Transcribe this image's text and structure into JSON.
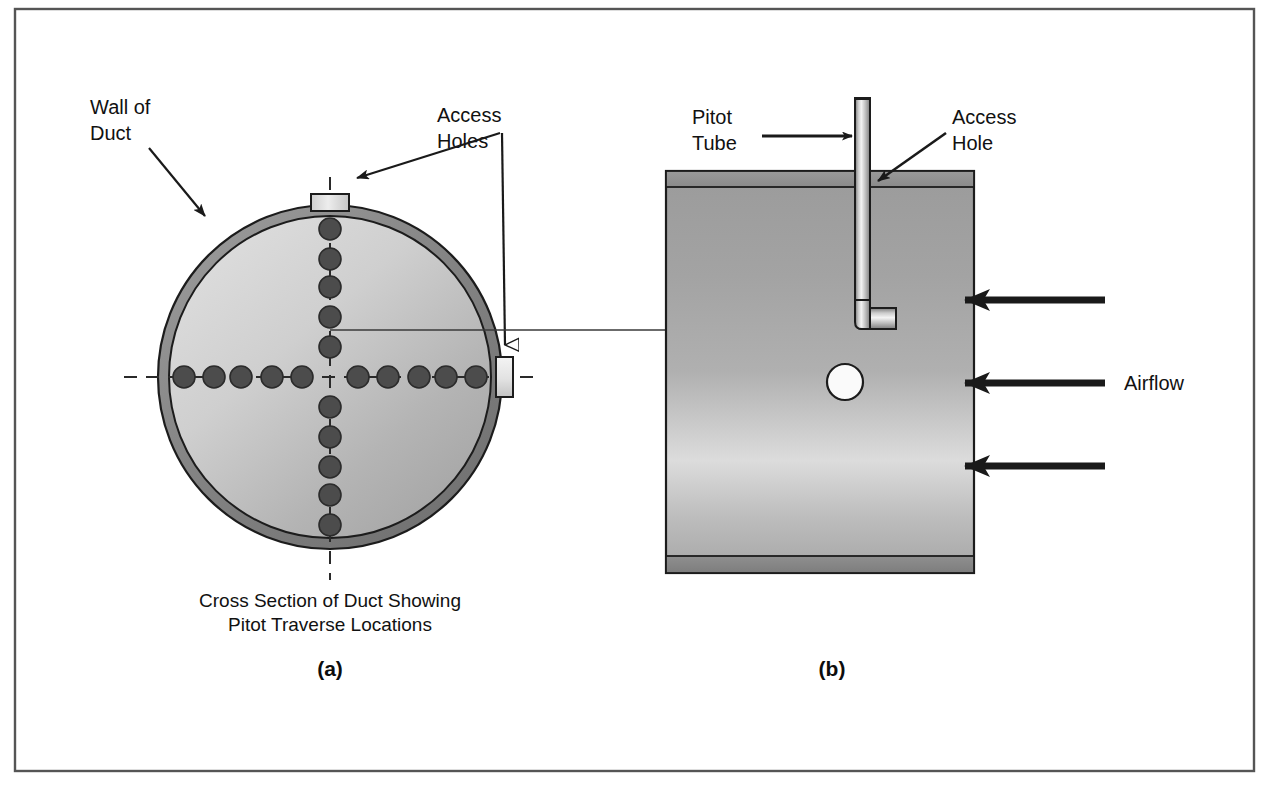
{
  "figure": {
    "frame_border_color": "#555555",
    "background_color": "#ffffff"
  },
  "panel_a": {
    "letter": "(a)",
    "caption_line1": "Cross Section of Duct Showing",
    "caption_line2": "Pitot Traverse Locations",
    "labels": {
      "wall_of_duct_line1": "Wall of",
      "wall_of_duct_line2": "Duct",
      "access_holes_line1": "Access",
      "access_holes_line2": "Holes"
    },
    "duct": {
      "center_x": 330,
      "center_y": 377,
      "outer_radius": 172,
      "wall_thickness": 11,
      "wall_color": "#8d8d8d",
      "interior_fill_light": "#d2d2d2",
      "interior_fill_dark": "#a9a9a9",
      "outline_color": "#1f1f1f"
    },
    "traverse_points": {
      "count_horizontal": 10,
      "count_vertical": 10,
      "dot_radius": 11,
      "dot_color": "#4a4a4a",
      "dot_outline": "#2b2b2b",
      "horizontal_offsets": [
        -146,
        -116,
        -89,
        -58,
        -28,
        28,
        58,
        89,
        116,
        146
      ],
      "vertical_offsets": [
        -148,
        -118,
        -90,
        -60,
        -30,
        30,
        60,
        90,
        118,
        148
      ]
    },
    "access_hole_top": {
      "x": 312,
      "y": 193,
      "w": 36,
      "h": 16
    },
    "access_hole_right": {
      "x": 497,
      "y": 357,
      "w": 16,
      "h": 40
    }
  },
  "panel_b": {
    "letter": "(b)",
    "labels": {
      "pitot_tube_line1": "Pitot",
      "pitot_tube_line2": "Tube",
      "access_hole_line1": "Access",
      "access_hole_line2": "Hole",
      "airflow": "Airflow"
    },
    "duct": {
      "x": 666,
      "y": 171,
      "width": 308,
      "height": 402,
      "body_light": "#e6e6e6",
      "body_mid": "#a8a8a8",
      "band_color": "#909090",
      "outline_color": "#1f1f1f"
    },
    "pitot_tube": {
      "stem_x": 862,
      "stem_top_y": 98,
      "stem_width": 14,
      "elbow_y": 323,
      "foot_length": 36,
      "tube_light": "#f2f2f2",
      "tube_dark": "#8a8a8a",
      "outline_color": "#1f1f1f"
    },
    "access_hole": {
      "x": 856,
      "y": 171,
      "w": 9,
      "h": 22
    },
    "wall_port_circle": {
      "cx": 845,
      "cy": 382,
      "r": 17,
      "fill": "#fbfbfb"
    },
    "airflow_arrows": {
      "count": 3,
      "color": "#1a1a1a",
      "y_positions": [
        300,
        383,
        466
      ],
      "tail_x": 1105,
      "head_x": 955
    }
  }
}
